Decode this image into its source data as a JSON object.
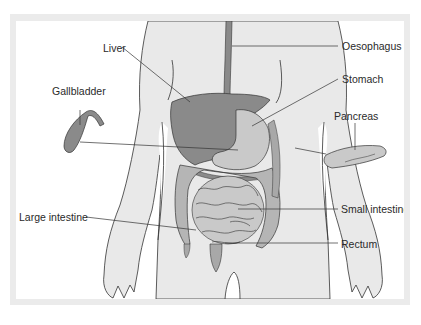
{
  "diagram": {
    "type": "anatomical-illustration",
    "labels": {
      "liver": "Liver",
      "oesophagus": "Oesophagus",
      "gallbladder": "Gallbladder",
      "stomach": "Stomach",
      "pancreas": "Pancreas",
      "large_intestine": "Large intestine",
      "small_intestine": "Small intestine",
      "rectum": "Rectum"
    },
    "colors": {
      "frame": "#ebebeb",
      "background": "#ffffff",
      "body": "#e9e9e9",
      "organ_dark": "#8a8a8a",
      "organ_mid": "#a8a8a8",
      "organ_light": "#c9c9c9",
      "outline": "#333333",
      "leader_line": "#333333"
    }
  }
}
